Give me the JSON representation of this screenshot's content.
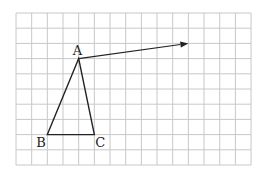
{
  "diagram": {
    "type": "grid-geometry",
    "grid": {
      "cols": 15,
      "rows": 10,
      "origin_px": [
        16,
        13
      ],
      "cell_w": 15.67,
      "cell_h": 15.2,
      "line_color": "#c8c8c8"
    },
    "triangle": {
      "vertices": [
        {
          "label": "A",
          "grid": [
            4,
            3
          ]
        },
        {
          "label": "B",
          "grid": [
            2,
            8
          ]
        },
        {
          "label": "C",
          "grid": [
            5,
            8
          ]
        }
      ],
      "stroke": "#222222"
    },
    "vector": {
      "from": "A",
      "from_grid": [
        4,
        3
      ],
      "to_grid": [
        11,
        2
      ],
      "stroke": "#222222"
    },
    "labels": {
      "a": "A",
      "b": "B",
      "c": "C"
    }
  }
}
